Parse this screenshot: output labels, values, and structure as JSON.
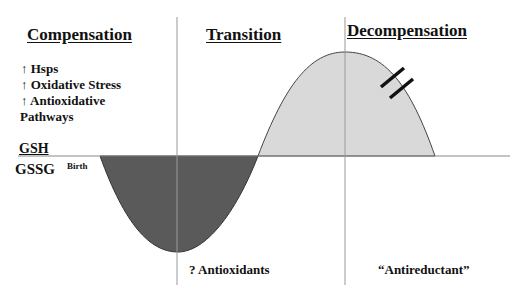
{
  "phases": [
    {
      "id": "compensation",
      "title": "Compensation"
    },
    {
      "id": "transition",
      "title": "Transition"
    },
    {
      "id": "decompensation",
      "title": "Decompensation"
    }
  ],
  "compensation_items": [
    {
      "arrow": "↑",
      "text": "Hsps"
    },
    {
      "arrow": "↑",
      "text": "Oxidative Stress"
    },
    {
      "arrow": "↑",
      "text": "Antioxidative"
    },
    {
      "arrow": "",
      "text": "Pathways"
    }
  ],
  "axis": {
    "ratio_numerator": "GSH",
    "ratio_denominator": "GSSG",
    "origin_label": "Birth"
  },
  "bottom_labels": {
    "transition": "? Antioxidants",
    "decompensation": "“Antireductant”"
  },
  "colors": {
    "negative_lobe": "#5a5a5a",
    "positive_lobe": "#d9d9d9",
    "lines": "#888888"
  }
}
